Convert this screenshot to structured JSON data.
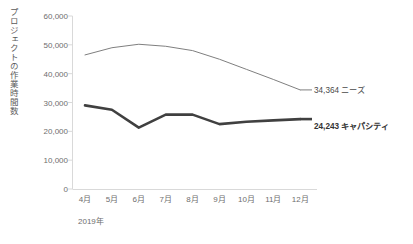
{
  "chart_data": {
    "type": "line",
    "title": "",
    "xlabel": "2019年",
    "ylabel": "プロジェクトの作業時間数",
    "categories": [
      "4月",
      "5月",
      "6月",
      "7月",
      "8月",
      "9月",
      "10月",
      "11月",
      "12月"
    ],
    "ylim": [
      0,
      60000
    ],
    "ytick_values": [
      0,
      10000,
      20000,
      30000,
      40000,
      50000,
      60000
    ],
    "ytick_labels": [
      "0",
      "10,000",
      "20,000",
      "30,000",
      "40,000",
      "50,000",
      "60,000"
    ],
    "grid": false,
    "legend_position": "end-of-line-labels",
    "series": [
      {
        "name": "ニーズ",
        "color": "#7f7f7f",
        "line_width": 1,
        "end_label": "34,364 ニーズ",
        "end_value": 34364,
        "values": [
          46500,
          49000,
          50200,
          49500,
          48000,
          45000,
          41500,
          38000,
          34364
        ]
      },
      {
        "name": "キャパシティ",
        "color": "#404040",
        "line_width": 2.6,
        "end_label": "24,243 キャパシティ",
        "end_value": 24243,
        "values": [
          29000,
          27500,
          21300,
          25800,
          25800,
          22500,
          23300,
          23800,
          24243
        ]
      }
    ]
  },
  "axis": {
    "axis_line_color": "#d9d9d9",
    "tick_color": "#d9d9d9"
  }
}
